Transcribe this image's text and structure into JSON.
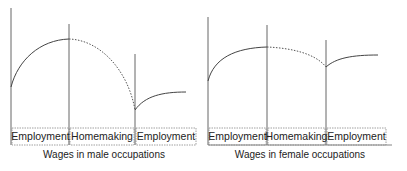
{
  "colors": {
    "line": "#555555",
    "box": "#888888",
    "text": "#222222",
    "background": "#ffffff"
  },
  "diagrams": [
    {
      "name": "male",
      "caption": "Wages in male occupations",
      "segments": [
        {
          "label": "Employment",
          "style": "solid"
        },
        {
          "label": "Homemaking",
          "style": "dashed"
        },
        {
          "label": "Employment",
          "style": "solid"
        }
      ]
    },
    {
      "name": "female",
      "caption": "Wages in female occupations",
      "segments": [
        {
          "label": "Employment",
          "style": "solid"
        },
        {
          "label": "Homemaking",
          "style": "dashed"
        },
        {
          "label": "Employment",
          "style": "solid"
        }
      ]
    }
  ]
}
